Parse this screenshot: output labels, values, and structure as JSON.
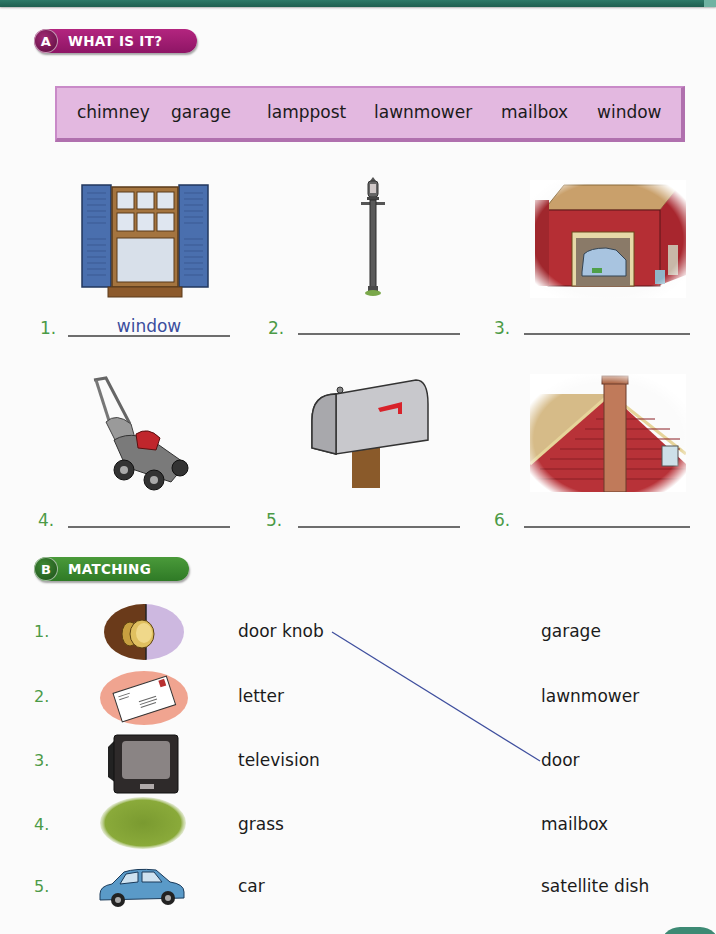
{
  "section_a": {
    "letter": "A",
    "title": "WHAT IS IT?",
    "color": "#a01f73",
    "word_bank": [
      "chimney",
      "garage",
      "lamppost",
      "lawnmower",
      "mailbox",
      "window"
    ],
    "items": [
      {
        "number": "1.",
        "picture": "window",
        "answer": "window"
      },
      {
        "number": "2.",
        "picture": "lamppost",
        "answer": ""
      },
      {
        "number": "3.",
        "picture": "garage",
        "answer": ""
      },
      {
        "number": "4.",
        "picture": "lawnmower",
        "answer": ""
      },
      {
        "number": "5.",
        "picture": "mailbox",
        "answer": ""
      },
      {
        "number": "6.",
        "picture": "chimney",
        "answer": ""
      }
    ]
  },
  "section_b": {
    "letter": "B",
    "title": "MATCHING",
    "color": "#3d8a30",
    "items": [
      {
        "number": "1.",
        "picture": "door-knob",
        "word": "door knob"
      },
      {
        "number": "2.",
        "picture": "letter",
        "word": "letter"
      },
      {
        "number": "3.",
        "picture": "television",
        "word": "television"
      },
      {
        "number": "4.",
        "picture": "grass",
        "word": "grass"
      },
      {
        "number": "5.",
        "picture": "car",
        "word": "car"
      }
    ],
    "options": [
      "garage",
      "lawnmower",
      "door",
      "mailbox",
      "satellite dish"
    ],
    "matches": [
      {
        "from": "door knob",
        "to": "door"
      }
    ]
  }
}
